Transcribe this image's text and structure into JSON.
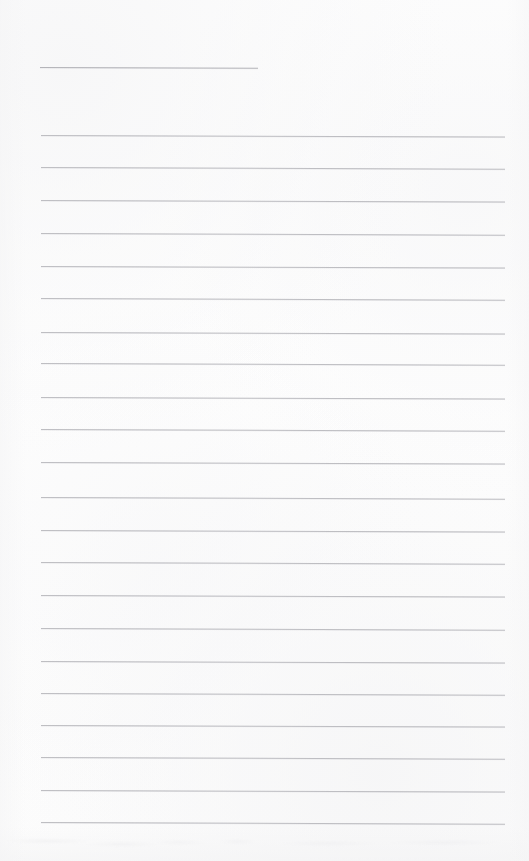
{
  "document": {
    "kind": "scanned-blank-ruled-page",
    "title": "",
    "body_text": "",
    "page_number": "",
    "canvas": {
      "width": 529,
      "height": 861
    },
    "colors": {
      "paper": "#fdfdfd",
      "header_rule": "#b0b0b5",
      "body_rule": "#bcbcc0"
    }
  },
  "header_rule": {
    "label": "header-underline",
    "x": 40,
    "y": 67,
    "width": 218,
    "skew_deg": 0.22,
    "color": "#b0b0b5"
  },
  "body_rules": {
    "label": "writing-lines",
    "count": 22,
    "x": 41,
    "width": 464,
    "color": "#bcbcc0",
    "spacing": 32.7,
    "lines": [
      {
        "index": 1,
        "y": 135,
        "skew_deg": 0.2
      },
      {
        "index": 2,
        "y": 167,
        "skew_deg": 0.22
      },
      {
        "index": 3,
        "y": 200,
        "skew_deg": 0.2
      },
      {
        "index": 4,
        "y": 233,
        "skew_deg": 0.21
      },
      {
        "index": 5,
        "y": 266,
        "skew_deg": 0.19
      },
      {
        "index": 6,
        "y": 298,
        "skew_deg": 0.22
      },
      {
        "index": 7,
        "y": 332,
        "skew_deg": 0.2
      },
      {
        "index": 8,
        "y": 363,
        "skew_deg": 0.21
      },
      {
        "index": 9,
        "y": 397,
        "skew_deg": 0.19
      },
      {
        "index": 10,
        "y": 429,
        "skew_deg": 0.22
      },
      {
        "index": 11,
        "y": 462,
        "skew_deg": 0.2
      },
      {
        "index": 12,
        "y": 497,
        "skew_deg": 0.21
      },
      {
        "index": 13,
        "y": 530,
        "skew_deg": 0.2
      },
      {
        "index": 14,
        "y": 562,
        "skew_deg": 0.22
      },
      {
        "index": 15,
        "y": 595,
        "skew_deg": 0.19
      },
      {
        "index": 16,
        "y": 628,
        "skew_deg": 0.21
      },
      {
        "index": 17,
        "y": 661,
        "skew_deg": 0.2
      },
      {
        "index": 18,
        "y": 693,
        "skew_deg": 0.22
      },
      {
        "index": 19,
        "y": 725,
        "skew_deg": 0.2
      },
      {
        "index": 20,
        "y": 757,
        "skew_deg": 0.21
      },
      {
        "index": 21,
        "y": 790,
        "skew_deg": 0.19
      },
      {
        "index": 22,
        "y": 822,
        "skew_deg": 0.22
      }
    ]
  }
}
